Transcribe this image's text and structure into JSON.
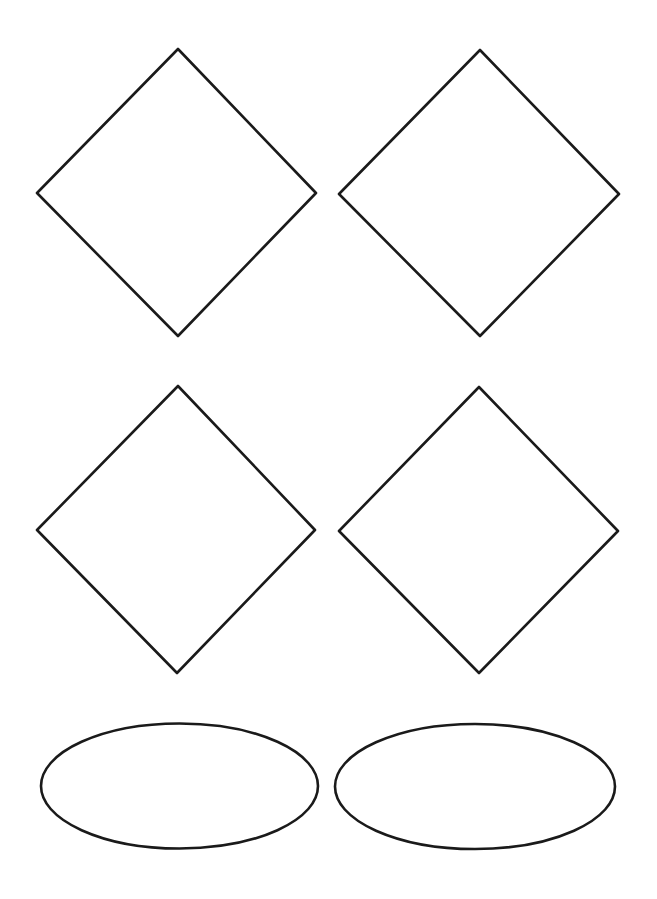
{
  "canvas": {
    "width": 657,
    "height": 899,
    "background": "#ffffff",
    "stroke_color": "#1a1a1a",
    "stroke_width": 2.6
  },
  "diagram": {
    "shapes": [
      {
        "id": "diamond-1",
        "type": "diamond",
        "row": 1,
        "col": 1,
        "points": [
          [
            178,
            49
          ],
          [
            316,
            193
          ],
          [
            178,
            336
          ],
          [
            37,
            193
          ]
        ],
        "label": ""
      },
      {
        "id": "diamond-2",
        "type": "diamond",
        "row": 1,
        "col": 2,
        "points": [
          [
            480,
            50
          ],
          [
            619,
            194
          ],
          [
            480,
            336
          ],
          [
            339,
            194
          ]
        ],
        "label": ""
      },
      {
        "id": "diamond-3",
        "type": "diamond",
        "row": 2,
        "col": 1,
        "points": [
          [
            178,
            386
          ],
          [
            315,
            530
          ],
          [
            177,
            673
          ],
          [
            37,
            530
          ]
        ],
        "label": ""
      },
      {
        "id": "diamond-4",
        "type": "diamond",
        "row": 2,
        "col": 2,
        "points": [
          [
            479,
            387
          ],
          [
            618,
            531
          ],
          [
            479,
            673
          ],
          [
            339,
            531
          ]
        ],
        "label": ""
      },
      {
        "id": "ellipse-1",
        "type": "ellipse",
        "row": 3,
        "col": 1,
        "cx": 179.5,
        "cy": 786,
        "rx": 138.5,
        "ry": 62.5,
        "label": ""
      },
      {
        "id": "ellipse-2",
        "type": "ellipse",
        "row": 3,
        "col": 2,
        "cx": 475,
        "cy": 786.5,
        "rx": 140,
        "ry": 62.5,
        "label": ""
      }
    ]
  }
}
